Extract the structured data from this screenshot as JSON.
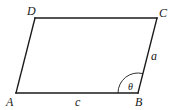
{
  "figure": {
    "type": "parallelogram",
    "vertices": {
      "A": {
        "label": "A",
        "x": 16,
        "y": 93
      },
      "B": {
        "label": "B",
        "x": 138,
        "y": 93
      },
      "C": {
        "label": "C",
        "x": 157,
        "y": 18
      },
      "D": {
        "label": "D",
        "x": 35,
        "y": 18
      }
    },
    "sides": {
      "AB": {
        "label": "c"
      },
      "BC": {
        "label": "a"
      }
    },
    "angle": {
      "vertex": "B",
      "label": "θ"
    },
    "stroke_color": "#1a1a1a"
  }
}
